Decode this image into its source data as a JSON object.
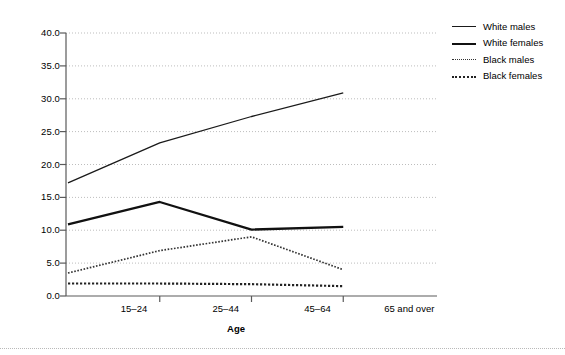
{
  "chart_data": {
    "type": "line",
    "title": "",
    "xlabel": "Age",
    "ylabel": "",
    "categories": [
      "15–24",
      "25–44",
      "45–64",
      "65 and over"
    ],
    "yticks": [
      "0.0",
      "5.0",
      "10.0",
      "15.0",
      "20.0",
      "25.0",
      "30.0",
      "35.0",
      "40.0"
    ],
    "ylim": [
      0,
      40
    ],
    "grid": true,
    "legend_position": "right-top",
    "series": [
      {
        "name": "White males",
        "style": "solid-thin",
        "color": "#1a1a1a",
        "values": [
          17.2,
          23.3,
          27.3,
          30.9
        ]
      },
      {
        "name": "White females",
        "style": "solid-thick",
        "color": "#111111",
        "values": [
          10.9,
          14.3,
          10.1,
          10.5
        ]
      },
      {
        "name": "Black males",
        "style": "dotted-fine",
        "color": "#333333",
        "values": [
          3.5,
          6.9,
          9.0,
          4.0
        ]
      },
      {
        "name": "Black females",
        "style": "dotted-coarse",
        "color": "#222222",
        "values": [
          1.9,
          1.9,
          1.8,
          1.5
        ]
      }
    ]
  },
  "axis": {
    "x_title": "Age"
  },
  "legend": {
    "items": [
      {
        "label": "White males"
      },
      {
        "label": "White females"
      },
      {
        "label": "Black males"
      },
      {
        "label": "Black females"
      }
    ]
  }
}
